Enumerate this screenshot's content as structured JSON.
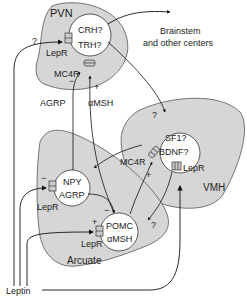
{
  "diagram": {
    "regions": {
      "pvn": {
        "label": "PVN",
        "fill": "#d6d6d6"
      },
      "vmh": {
        "label": "VMH",
        "fill": "#d6d6d6"
      },
      "arcuate": {
        "label": "Arcuate",
        "fill": "#d6d6d6"
      }
    },
    "neurons": {
      "pvn": {
        "line1": "CRH?",
        "line2": "TRH?"
      },
      "vmh": {
        "line1": "SF1?",
        "line2": "BDNF?"
      },
      "npy": {
        "line1": "NPY",
        "line2": "AGRP"
      },
      "pomc": {
        "line1": "POMC",
        "line2": "αMSH"
      }
    },
    "receptors": {
      "pvn_lepr": "LepR",
      "pvn_mc4r": "MC4R",
      "vmh_mc4r": "MC4R",
      "vmh_lepr": "LepR",
      "npy_lepr": "LepR",
      "pomc_lepr": "LepR"
    },
    "signals": {
      "agrp": "AGRP",
      "amsh": "αMSH",
      "leptin": "Leptin",
      "output_line1": "Brainstem",
      "output_line2": "and other centers"
    },
    "signs": {
      "minus": "−",
      "plus": "+",
      "unknown": "?"
    },
    "colors": {
      "region_fill": "#d6d6d6",
      "region_stroke": "#444444",
      "neuron_fill": "#ffffff",
      "line": "#111111"
    }
  }
}
